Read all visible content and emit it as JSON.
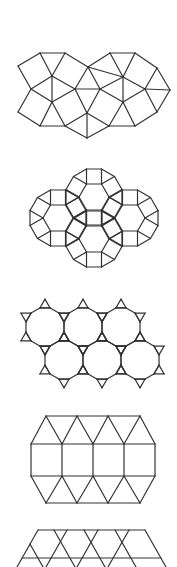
{
  "figures": [
    {
      "name": "snub-square-tiling",
      "type": "edges",
      "vertices": {
        "A": [
          40,
          53
        ],
        "B": [
          65,
          53
        ],
        "C": [
          18,
          66
        ],
        "D": [
          88,
          67
        ],
        "E": [
          110,
          53
        ],
        "F": [
          135,
          53
        ],
        "G": [
          157,
          68
        ],
        "H": [
          170,
          90
        ],
        "I": [
          157,
          112
        ],
        "J": [
          135,
          126
        ],
        "K": [
          109,
          126
        ],
        "L": [
          87,
          138
        ],
        "M": [
          65,
          126
        ],
        "N": [
          40,
          126
        ],
        "O": [
          18,
          112
        ],
        "P": [
          31,
          89
        ],
        "Q": [
          52,
          76
        ],
        "R": [
          52,
          102
        ],
        "S": [
          75,
          89
        ],
        "T": [
          100,
          89
        ],
        "U": [
          87,
          113
        ],
        "V": [
          123,
          77
        ],
        "W": [
          123,
          102
        ],
        "X": [
          145,
          89
        ]
      },
      "edges": [
        [
          "A",
          "B"
        ],
        [
          "A",
          "C"
        ],
        [
          "C",
          "P"
        ],
        [
          "A",
          "Q"
        ],
        [
          "B",
          "Q"
        ],
        [
          "B",
          "D"
        ],
        [
          "P",
          "Q"
        ],
        [
          "Q",
          "S"
        ],
        [
          "Q",
          "R"
        ],
        [
          "P",
          "R"
        ],
        [
          "P",
          "O"
        ],
        [
          "O",
          "N"
        ],
        [
          "N",
          "R"
        ],
        [
          "N",
          "M"
        ],
        [
          "M",
          "R"
        ],
        [
          "R",
          "S"
        ],
        [
          "D",
          "S"
        ],
        [
          "D",
          "T"
        ],
        [
          "S",
          "T"
        ],
        [
          "S",
          "U"
        ],
        [
          "T",
          "U"
        ],
        [
          "U",
          "M"
        ],
        [
          "U",
          "L"
        ],
        [
          "M",
          "L"
        ],
        [
          "L",
          "K"
        ],
        [
          "U",
          "K"
        ],
        [
          "T",
          "V"
        ],
        [
          "T",
          "W"
        ],
        [
          "W",
          "K"
        ],
        [
          "D",
          "V"
        ],
        [
          "D",
          "E"
        ],
        [
          "E",
          "V"
        ],
        [
          "E",
          "F"
        ],
        [
          "F",
          "V"
        ],
        [
          "F",
          "G"
        ],
        [
          "G",
          "X"
        ],
        [
          "V",
          "X"
        ],
        [
          "V",
          "W"
        ],
        [
          "X",
          "H"
        ],
        [
          "G",
          "H"
        ],
        [
          "H",
          "I"
        ],
        [
          "X",
          "I"
        ],
        [
          "X",
          "W"
        ],
        [
          "W",
          "J"
        ],
        [
          "I",
          "J"
        ],
        [
          "J",
          "K"
        ]
      ]
    },
    {
      "name": "rhombitrihexagonal-tiling",
      "type": "rhombitrihex",
      "edge": 15,
      "centers": [
        [
          94,
          197
        ],
        [
          58,
          218
        ],
        [
          130,
          218
        ],
        [
          94,
          239
        ]
      ]
    },
    {
      "name": "truncated-hexagonal-tiling",
      "type": "trunchex",
      "edge": 10.2,
      "centers": [
        [
          45,
          327
        ],
        [
          83,
          327
        ],
        [
          121,
          327
        ],
        [
          64,
          360
        ],
        [
          102,
          360
        ],
        [
          140,
          360
        ]
      ]
    },
    {
      "name": "elongated-triangular-tiling",
      "type": "edges",
      "vertices": {
        "t0": [
          46,
          416
        ],
        "t1": [
          77,
          416
        ],
        "t2": [
          108,
          416
        ],
        "t3": [
          140,
          416
        ],
        "s0": [
          31,
          444
        ],
        "s1": [
          62,
          444
        ],
        "s2": [
          93,
          444
        ],
        "s3": [
          124,
          444
        ],
        "s4": [
          155,
          444
        ],
        "u0": [
          31,
          476
        ],
        "u1": [
          62,
          476
        ],
        "u2": [
          93,
          476
        ],
        "u3": [
          124,
          476
        ],
        "u4": [
          155,
          476
        ],
        "b0": [
          46,
          503
        ],
        "b1": [
          77,
          503
        ],
        "b2": [
          108,
          503
        ],
        "b3": [
          140,
          503
        ]
      },
      "edges": [
        [
          "t0",
          "t3"
        ],
        [
          "s0",
          "s4"
        ],
        [
          "u0",
          "u4"
        ],
        [
          "b0",
          "b3"
        ],
        [
          "s0",
          "u0"
        ],
        [
          "s1",
          "u1"
        ],
        [
          "s2",
          "u2"
        ],
        [
          "s3",
          "u3"
        ],
        [
          "s4",
          "u4"
        ],
        [
          "s0",
          "t0"
        ],
        [
          "t0",
          "s1"
        ],
        [
          "s1",
          "t1"
        ],
        [
          "t1",
          "s2"
        ],
        [
          "s2",
          "t2"
        ],
        [
          "t2",
          "s3"
        ],
        [
          "s3",
          "t3"
        ],
        [
          "t3",
          "s4"
        ],
        [
          "u0",
          "b0"
        ],
        [
          "b0",
          "u1"
        ],
        [
          "u1",
          "b1"
        ],
        [
          "b1",
          "u2"
        ],
        [
          "u2",
          "b2"
        ],
        [
          "b2",
          "u3"
        ],
        [
          "u3",
          "b3"
        ],
        [
          "b3",
          "u4"
        ]
      ]
    },
    {
      "name": "trihexagonal-tiling-partial",
      "type": "segments",
      "segments": [
        [
          38,
          530,
          145,
          530
        ],
        [
          22,
          558,
          161,
          558
        ],
        [
          38,
          530,
          17,
          567
        ],
        [
          145,
          530,
          166,
          567
        ],
        [
          30,
          544,
          43,
          567
        ],
        [
          54,
          530,
          75,
          567
        ],
        [
          67,
          530,
          46,
          567
        ],
        [
          84,
          530,
          105,
          567
        ],
        [
          98,
          530,
          77,
          567
        ],
        [
          115,
          530,
          136,
          567
        ],
        [
          129,
          530,
          108,
          567
        ]
      ]
    }
  ],
  "style": {
    "stroke": "#333333",
    "background": "#ffffff"
  }
}
